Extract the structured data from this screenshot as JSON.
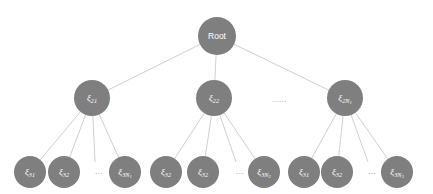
{
  "diagram": {
    "type": "tree",
    "levels": 3,
    "background_color": "#ffffff",
    "node_color": "#7f7f7f",
    "node_text_color": "#ffffff",
    "edge_color": "#d0d0d0",
    "root": {
      "label": "Root",
      "cx": 217,
      "cy": 36,
      "r": 19
    },
    "level2": {
      "radius": 18,
      "ellipsis": "......",
      "ellipsis_x": 272,
      "ellipsis_y": 96,
      "nodes": [
        {
          "symbol": "ξ",
          "sub": "21",
          "subsub": "",
          "cx": 92,
          "cy": 98
        },
        {
          "symbol": "ξ",
          "sub": "22",
          "subsub": "",
          "cx": 214,
          "cy": 98
        },
        {
          "symbol": "ξ",
          "sub": "2N",
          "subsub": "1",
          "cx": 345,
          "cy": 98
        }
      ]
    },
    "level3": {
      "radius": 16,
      "cy": 172,
      "groups": [
        {
          "parent_index": 0,
          "ellipsis": "...",
          "ellipsis_x": 95,
          "nodes": [
            {
              "symbol": "ξ",
              "sub": "31",
              "subsub": "",
              "cx": 30
            },
            {
              "symbol": "ξ",
              "sub": "32",
              "subsub": "",
              "cx": 64
            },
            {
              "symbol": "ξ",
              "sub": "3N",
              "subsub": "1",
              "cx": 125
            }
          ]
        },
        {
          "parent_index": 1,
          "ellipsis": "...",
          "ellipsis_x": 236,
          "nodes": [
            {
              "symbol": "ξ",
              "sub": "32",
              "subsub": "",
              "cx": 166
            },
            {
              "symbol": "ξ",
              "sub": "32",
              "subsub": "",
              "cx": 203
            },
            {
              "symbol": "ξ",
              "sub": "3N",
              "subsub": "2",
              "cx": 264
            }
          ]
        },
        {
          "parent_index": 2,
          "ellipsis": "...",
          "ellipsis_x": 368,
          "nodes": [
            {
              "symbol": "ξ",
              "sub": "31",
              "subsub": "",
              "cx": 304
            },
            {
              "symbol": "ξ",
              "sub": "32",
              "subsub": "",
              "cx": 337
            },
            {
              "symbol": "ξ",
              "sub": "3N",
              "subsub": "3",
              "cx": 397
            }
          ]
        }
      ]
    }
  }
}
